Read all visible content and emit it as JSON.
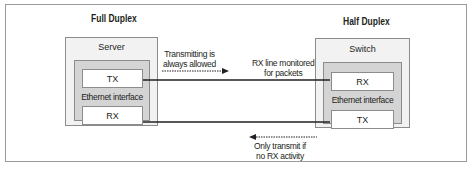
{
  "diagram": {
    "left": {
      "heading": "Full Duplex",
      "device": "Server",
      "interface": "Ethernet interface",
      "ports": {
        "top": "TX",
        "bottom": "RX"
      }
    },
    "right": {
      "heading": "Half Duplex",
      "device": "Switch",
      "interface": "Ethernet interface",
      "ports": {
        "top": "RX",
        "bottom": "TX"
      }
    },
    "annotations": {
      "top_left_line1": "Transmitting is",
      "top_left_line2": "always allowed",
      "top_right_line1": "RX line monitored",
      "top_right_line2": "for packets",
      "bottom_line1": "Only transmit if",
      "bottom_line2": "no RX activity"
    },
    "colors": {
      "device_fill": "#f2f2f2",
      "interface_fill": "#d4d4d4",
      "port_fill": "#ffffff",
      "border": "#8c8c8c",
      "line": "#231f20"
    }
  }
}
